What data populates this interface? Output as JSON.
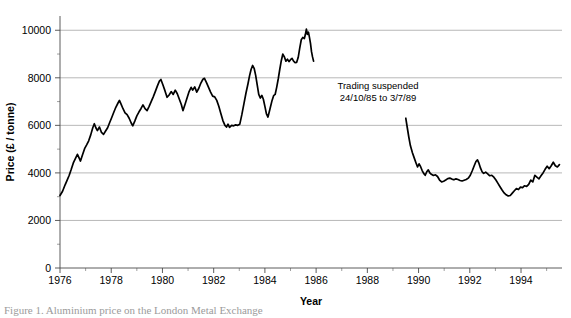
{
  "figure": {
    "background_color": "#ffffff",
    "series_color": "#000000",
    "grid_color": "#9a9a9a",
    "axis_color": "#4a4a4a",
    "caption_partial": "Figure 1. Aluminium price on the London Metal Exchange"
  },
  "annotation": {
    "line1": "Trading suspended",
    "line2": "24/10/85 to 3/7/89"
  },
  "chart_data": {
    "type": "line",
    "title": "",
    "xlabel": "Year",
    "ylabel": "Price (£ / tonne)",
    "xlim": [
      1976,
      1995.6
    ],
    "ylim": [
      0,
      10600
    ],
    "grid": true,
    "legend": "none",
    "x_ticks": [
      1976,
      1978,
      1980,
      1982,
      1984,
      1986,
      1988,
      1990,
      1992,
      1994
    ],
    "x_tick_labels": [
      "1976",
      "1978",
      "1980",
      "1982",
      "1984",
      "1986",
      "1988",
      "1990",
      "1992",
      "1994"
    ],
    "x_minor_tick_interval": 1,
    "y_ticks": [
      0,
      2000,
      4000,
      6000,
      8000,
      10000
    ],
    "y_tick_labels": [
      "0",
      "2000",
      "4000",
      "6000",
      "8000",
      "10000"
    ],
    "y_minor_tick_interval": 1000,
    "gridline_values": [
      2000,
      4000,
      6000,
      8000,
      10000
    ],
    "annotations": [
      {
        "text": "Trading suspended 24/10/85 to 3/7/89",
        "x": 1987.35,
        "y": 7050
      }
    ],
    "series": [
      {
        "name": "Aluminium price segment 1",
        "x_start": 1976.0,
        "x_end": 1985.75,
        "points": [
          [
            1976.0,
            3050
          ],
          [
            1976.1,
            3230
          ],
          [
            1976.2,
            3500
          ],
          [
            1976.28,
            3700
          ],
          [
            1976.36,
            3900
          ],
          [
            1976.44,
            4150
          ],
          [
            1976.52,
            4420
          ],
          [
            1976.6,
            4600
          ],
          [
            1976.68,
            4780
          ],
          [
            1976.74,
            4640
          ],
          [
            1976.8,
            4500
          ],
          [
            1976.88,
            4760
          ],
          [
            1976.96,
            5020
          ],
          [
            1977.04,
            5180
          ],
          [
            1977.12,
            5350
          ],
          [
            1977.2,
            5600
          ],
          [
            1977.28,
            5900
          ],
          [
            1977.34,
            6070
          ],
          [
            1977.4,
            5900
          ],
          [
            1977.46,
            5780
          ],
          [
            1977.54,
            5930
          ],
          [
            1977.62,
            5700
          ],
          [
            1977.7,
            5620
          ],
          [
            1977.78,
            5760
          ],
          [
            1977.86,
            5900
          ],
          [
            1977.94,
            6120
          ],
          [
            1978.02,
            6330
          ],
          [
            1978.1,
            6550
          ],
          [
            1978.18,
            6760
          ],
          [
            1978.26,
            6930
          ],
          [
            1978.32,
            7050
          ],
          [
            1978.38,
            6900
          ],
          [
            1978.46,
            6700
          ],
          [
            1978.54,
            6530
          ],
          [
            1978.62,
            6450
          ],
          [
            1978.7,
            6300
          ],
          [
            1978.78,
            6100
          ],
          [
            1978.84,
            5980
          ],
          [
            1978.92,
            6180
          ],
          [
            1979.0,
            6400
          ],
          [
            1979.08,
            6560
          ],
          [
            1979.16,
            6700
          ],
          [
            1979.24,
            6860
          ],
          [
            1979.32,
            6700
          ],
          [
            1979.4,
            6620
          ],
          [
            1979.48,
            6800
          ],
          [
            1979.56,
            7000
          ],
          [
            1979.64,
            7200
          ],
          [
            1979.72,
            7420
          ],
          [
            1979.8,
            7650
          ],
          [
            1979.88,
            7860
          ],
          [
            1979.94,
            7930
          ],
          [
            1980.02,
            7700
          ],
          [
            1980.1,
            7450
          ],
          [
            1980.18,
            7180
          ],
          [
            1980.26,
            7280
          ],
          [
            1980.34,
            7420
          ],
          [
            1980.42,
            7300
          ],
          [
            1980.5,
            7480
          ],
          [
            1980.58,
            7330
          ],
          [
            1980.66,
            7100
          ],
          [
            1980.74,
            6870
          ],
          [
            1980.8,
            6620
          ],
          [
            1980.88,
            6880
          ],
          [
            1980.96,
            7150
          ],
          [
            1981.04,
            7420
          ],
          [
            1981.12,
            7600
          ],
          [
            1981.18,
            7480
          ],
          [
            1981.26,
            7620
          ],
          [
            1981.34,
            7400
          ],
          [
            1981.42,
            7560
          ],
          [
            1981.5,
            7780
          ],
          [
            1981.58,
            7940
          ],
          [
            1981.64,
            7980
          ],
          [
            1981.72,
            7800
          ],
          [
            1981.8,
            7600
          ],
          [
            1981.88,
            7400
          ],
          [
            1981.96,
            7230
          ],
          [
            1982.04,
            7200
          ],
          [
            1982.12,
            7050
          ],
          [
            1982.2,
            6800
          ],
          [
            1982.28,
            6500
          ],
          [
            1982.36,
            6200
          ],
          [
            1982.44,
            6000
          ],
          [
            1982.5,
            5930
          ],
          [
            1982.56,
            6050
          ],
          [
            1982.62,
            5920
          ],
          [
            1982.7,
            6000
          ],
          [
            1982.78,
            5980
          ],
          [
            1982.86,
            6020
          ],
          [
            1982.94,
            6000
          ],
          [
            1983.02,
            6050
          ],
          [
            1983.1,
            6450
          ],
          [
            1983.18,
            6900
          ],
          [
            1983.26,
            7350
          ],
          [
            1983.34,
            7750
          ],
          [
            1983.4,
            8080
          ],
          [
            1983.46,
            8350
          ],
          [
            1983.52,
            8520
          ],
          [
            1983.58,
            8400
          ],
          [
            1983.64,
            8100
          ],
          [
            1983.7,
            7700
          ],
          [
            1983.76,
            7300
          ],
          [
            1983.82,
            7150
          ],
          [
            1983.88,
            7260
          ],
          [
            1983.94,
            7100
          ],
          [
            1984.0,
            6800
          ],
          [
            1984.06,
            6480
          ],
          [
            1984.12,
            6350
          ],
          [
            1984.2,
            6700
          ],
          [
            1984.28,
            7050
          ],
          [
            1984.34,
            7250
          ],
          [
            1984.4,
            7300
          ],
          [
            1984.46,
            7600
          ],
          [
            1984.52,
            7950
          ],
          [
            1984.58,
            8350
          ],
          [
            1984.64,
            8720
          ],
          [
            1984.7,
            9000
          ],
          [
            1984.76,
            8880
          ],
          [
            1984.82,
            8700
          ],
          [
            1984.88,
            8780
          ],
          [
            1984.94,
            8680
          ],
          [
            1985.0,
            8760
          ],
          [
            1985.06,
            8820
          ],
          [
            1985.12,
            8700
          ],
          [
            1985.18,
            8640
          ],
          [
            1985.24,
            8650
          ],
          [
            1985.3,
            8850
          ],
          [
            1985.36,
            9250
          ],
          [
            1985.42,
            9600
          ],
          [
            1985.48,
            9700
          ],
          [
            1985.54,
            9650
          ],
          [
            1985.58,
            9820
          ],
          [
            1985.62,
            10050
          ],
          [
            1985.66,
            9830
          ],
          [
            1985.7,
            9920
          ],
          [
            1985.74,
            9700
          ],
          [
            1985.78,
            9450
          ],
          [
            1985.82,
            9100
          ],
          [
            1985.86,
            8880
          ],
          [
            1985.9,
            8700
          ]
        ]
      },
      {
        "name": "Aluminium price segment 2",
        "x_start": 1989.5,
        "x_end": 1995.5,
        "points": [
          [
            1989.5,
            6300
          ],
          [
            1989.56,
            5900
          ],
          [
            1989.62,
            5500
          ],
          [
            1989.68,
            5150
          ],
          [
            1989.76,
            4850
          ],
          [
            1989.84,
            4600
          ],
          [
            1989.9,
            4420
          ],
          [
            1989.96,
            4250
          ],
          [
            1990.02,
            4380
          ],
          [
            1990.08,
            4260
          ],
          [
            1990.14,
            4100
          ],
          [
            1990.2,
            3980
          ],
          [
            1990.26,
            3900
          ],
          [
            1990.32,
            4050
          ],
          [
            1990.38,
            4130
          ],
          [
            1990.44,
            4000
          ],
          [
            1990.5,
            3940
          ],
          [
            1990.58,
            3890
          ],
          [
            1990.66,
            3920
          ],
          [
            1990.74,
            3850
          ],
          [
            1990.82,
            3700
          ],
          [
            1990.9,
            3620
          ],
          [
            1990.98,
            3650
          ],
          [
            1991.06,
            3700
          ],
          [
            1991.14,
            3760
          ],
          [
            1991.22,
            3780
          ],
          [
            1991.3,
            3740
          ],
          [
            1991.38,
            3710
          ],
          [
            1991.46,
            3750
          ],
          [
            1991.54,
            3720
          ],
          [
            1991.62,
            3680
          ],
          [
            1991.7,
            3660
          ],
          [
            1991.78,
            3690
          ],
          [
            1991.86,
            3720
          ],
          [
            1991.94,
            3780
          ],
          [
            1992.02,
            3900
          ],
          [
            1992.1,
            4100
          ],
          [
            1992.18,
            4320
          ],
          [
            1992.24,
            4480
          ],
          [
            1992.3,
            4550
          ],
          [
            1992.36,
            4400
          ],
          [
            1992.42,
            4200
          ],
          [
            1992.48,
            4050
          ],
          [
            1992.54,
            3980
          ],
          [
            1992.62,
            4030
          ],
          [
            1992.7,
            3960
          ],
          [
            1992.78,
            3880
          ],
          [
            1992.86,
            3900
          ],
          [
            1992.94,
            3820
          ],
          [
            1993.02,
            3700
          ],
          [
            1993.1,
            3560
          ],
          [
            1993.18,
            3420
          ],
          [
            1993.26,
            3280
          ],
          [
            1993.34,
            3160
          ],
          [
            1993.42,
            3080
          ],
          [
            1993.5,
            3030
          ],
          [
            1993.58,
            3050
          ],
          [
            1993.66,
            3150
          ],
          [
            1993.74,
            3250
          ],
          [
            1993.82,
            3340
          ],
          [
            1993.9,
            3300
          ],
          [
            1993.98,
            3400
          ],
          [
            1994.06,
            3380
          ],
          [
            1994.14,
            3460
          ],
          [
            1994.22,
            3430
          ],
          [
            1994.3,
            3520
          ],
          [
            1994.38,
            3700
          ],
          [
            1994.46,
            3620
          ],
          [
            1994.54,
            3900
          ],
          [
            1994.62,
            3820
          ],
          [
            1994.7,
            3750
          ],
          [
            1994.78,
            3880
          ],
          [
            1994.86,
            4000
          ],
          [
            1994.94,
            4150
          ],
          [
            1995.02,
            4280
          ],
          [
            1995.1,
            4180
          ],
          [
            1995.18,
            4300
          ],
          [
            1995.26,
            4450
          ],
          [
            1995.34,
            4300
          ],
          [
            1995.42,
            4250
          ],
          [
            1995.5,
            4350
          ]
        ]
      }
    ]
  }
}
